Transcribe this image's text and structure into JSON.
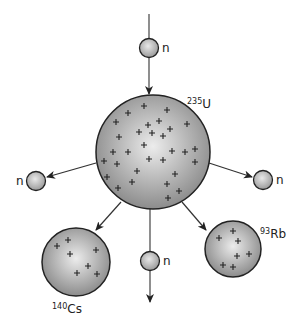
{
  "diagram": {
    "colors": {
      "outline": "#222222",
      "sphere_light": "#e6e6e6",
      "sphere_dark": "#8f8f8f",
      "background": "#ffffff"
    },
    "neutron_label": "n",
    "nuclei": {
      "uranium": {
        "mass": "235",
        "symbol": "U",
        "proton_marks": 38
      },
      "cesium": {
        "mass": "140",
        "symbol": "Cs",
        "proton_marks": 7
      },
      "rubidium": {
        "mass": "93",
        "symbol": "Rb",
        "proton_marks": 7
      }
    },
    "neutrons": [
      {
        "id": "incoming",
        "label": "n"
      },
      {
        "id": "left",
        "label": "n"
      },
      {
        "id": "right",
        "label": "n"
      },
      {
        "id": "bottom",
        "label": "n"
      }
    ],
    "arrows": [
      {
        "from": "incoming-neutron",
        "to": "uranium-nucleus"
      },
      {
        "from": "uranium-nucleus",
        "to": "left-neutron"
      },
      {
        "from": "uranium-nucleus",
        "to": "right-neutron"
      },
      {
        "from": "uranium-nucleus",
        "to": "cesium-nucleus"
      },
      {
        "from": "uranium-nucleus",
        "to": "rubidium-nucleus"
      },
      {
        "from": "uranium-nucleus",
        "to": "bottom-neutron"
      }
    ]
  }
}
